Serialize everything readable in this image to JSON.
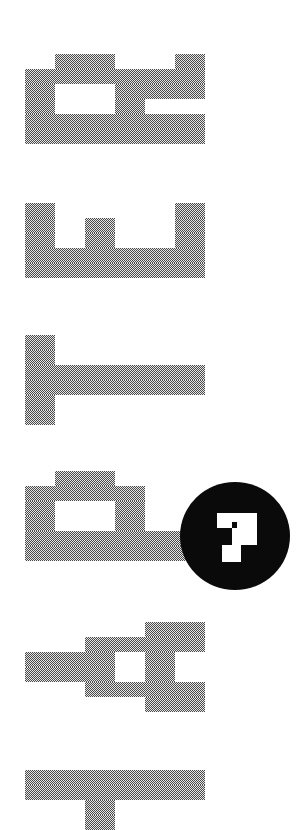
{
  "page": {
    "title_text": "CHAPTER",
    "orientation": "rotated -90deg, reading bottom to top",
    "chapter_number": "7"
  },
  "colors": {
    "background": "#ffffff",
    "dither_dark": "#4a4a4a",
    "dither_light": "#e6e6e6",
    "badge_fill": "#0a0a0a",
    "badge_numeral": "#ffffff"
  },
  "grid": {
    "origin_x": 25,
    "cell_width": 30,
    "cell_height": 15
  },
  "glyphs": [
    {
      "letter": "R",
      "top": 54,
      "rows": [
        [
          1,
          2,
          5
        ],
        [
          0,
          1,
          2,
          3,
          4,
          5
        ],
        [
          0,
          3,
          4,
          5
        ],
        [
          0,
          3
        ],
        [
          0,
          1,
          2,
          3,
          4,
          5
        ],
        [
          0,
          1,
          2,
          3,
          4,
          5
        ]
      ]
    },
    {
      "letter": "E",
      "top": 203,
      "rows": [
        [
          0,
          5
        ],
        [
          0,
          2,
          5
        ],
        [
          0,
          2,
          5
        ],
        [
          0,
          1,
          2,
          3,
          4,
          5
        ],
        [
          0,
          1,
          2,
          3,
          4,
          5
        ]
      ]
    },
    {
      "letter": "T",
      "top": 335,
      "rows": [
        [
          0
        ],
        [
          0
        ],
        [
          0,
          1,
          2,
          3,
          4,
          5
        ],
        [
          0,
          1,
          2,
          3,
          4,
          5
        ],
        [
          0
        ],
        [
          0
        ]
      ]
    },
    {
      "letter": "P",
      "top": 471,
      "rows": [
        [
          1,
          2
        ],
        [
          0,
          1,
          2,
          3
        ],
        [
          0,
          3
        ],
        [
          0,
          3
        ],
        [
          0,
          1,
          2,
          3,
          4,
          5
        ],
        [
          0,
          1,
          2,
          3,
          4,
          5
        ]
      ]
    },
    {
      "letter": "A",
      "top": 622,
      "rows": [
        [
          4,
          5
        ],
        [
          2,
          3,
          4,
          5
        ],
        [
          0,
          1,
          2,
          4
        ],
        [
          0,
          1,
          2,
          4
        ],
        [
          2,
          3,
          4,
          5
        ],
        [
          4,
          5
        ]
      ]
    },
    {
      "letter": "H",
      "top": 770,
      "rows": [
        [
          0,
          1,
          2,
          3,
          4,
          5
        ],
        [
          0,
          1,
          2,
          3,
          4,
          5
        ],
        [
          2
        ],
        [
          2
        ],
        [
          0,
          1,
          2,
          3,
          4,
          5
        ]
      ]
    }
  ],
  "badge": {
    "label": "7",
    "numeral_pixels": [
      {
        "x": 37,
        "y": 31,
        "w": 40,
        "h": 9
      },
      {
        "x": 37,
        "y": 40,
        "w": 15,
        "h": 6
      },
      {
        "x": 57,
        "y": 40,
        "w": 20,
        "h": 6
      },
      {
        "x": 52,
        "y": 46,
        "w": 25,
        "h": 17
      },
      {
        "x": 42,
        "y": 63,
        "w": 19,
        "h": 17
      }
    ]
  }
}
